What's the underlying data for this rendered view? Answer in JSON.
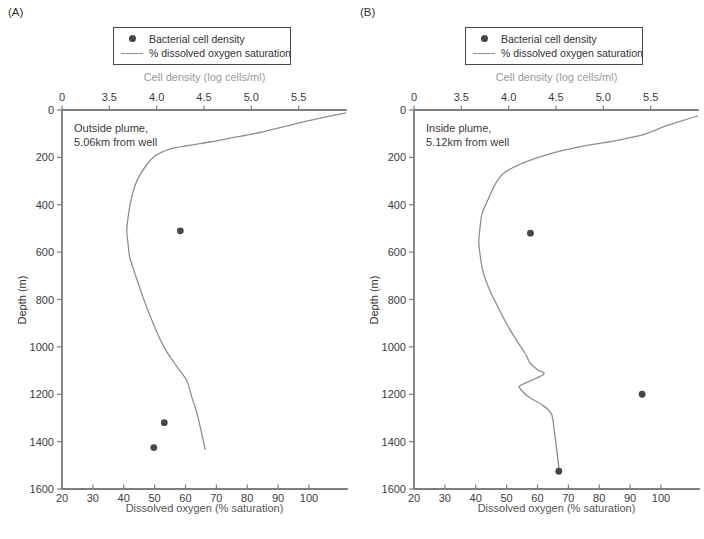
{
  "panels": {
    "a": {
      "letter": "(A)",
      "annotation_line1": "Outside plume,",
      "annotation_line2": "5.06km from well",
      "top_axis_label": "Cell density (log cells/ml)",
      "bottom_axis_label": "Dissolved oxygen (% saturation)",
      "y_axis_label": "Depth (m)"
    },
    "b": {
      "letter": "(B)",
      "annotation_line1": "Inside plume,",
      "annotation_line2": "5.12km from well",
      "top_axis_label": "Cell density (log cells/ml)",
      "bottom_axis_label": "Dissolved oxygen (% saturation)",
      "y_axis_label": "Depth (m)"
    }
  },
  "legend": {
    "items": [
      {
        "icon": "filled-circle",
        "label": "Bacterial cell density"
      },
      {
        "icon": "line",
        "label": "% dissolved oxygen saturation"
      }
    ]
  },
  "colors": {
    "axis": "#7f7f7f",
    "curve": "#8f8f8f",
    "dot": "#474747",
    "tick_text": "#3c3c3c",
    "top_label": "#9a9a9a",
    "bottom_label": "#555555",
    "text": "#333333"
  },
  "chart_data": [
    {
      "panel": "A",
      "type": "line",
      "title": "Outside plume, 5.06km from well",
      "x_top_axis": {
        "label": "Cell density (log cells/ml)",
        "tick_labels": [
          "0",
          "3.5",
          "4.0",
          "4.5",
          "5.0",
          "5.5"
        ],
        "units": "log cells/ml"
      },
      "x_bottom_axis": {
        "label": "Dissolved oxygen (% saturation)",
        "tick_labels": [
          "20",
          "30",
          "40",
          "50",
          "60",
          "70",
          "80",
          "90",
          "100"
        ],
        "range": [
          20,
          112
        ]
      },
      "y_axis": {
        "label": "Depth (m)",
        "tick_labels": [
          "0",
          "200",
          "400",
          "600",
          "800",
          "1000",
          "1200",
          "1400",
          "1600"
        ],
        "range": [
          0,
          1600
        ],
        "inverted": true
      },
      "oxygen_profile_pct_vs_depth_m": [
        [
          112,
          12
        ],
        [
          107,
          25
        ],
        [
          100,
          45
        ],
        [
          92,
          70
        ],
        [
          84,
          95
        ],
        [
          76,
          115
        ],
        [
          68,
          135
        ],
        [
          60,
          152
        ],
        [
          55,
          165
        ],
        [
          52,
          180
        ],
        [
          49.5,
          200
        ],
        [
          47.5,
          230
        ],
        [
          45.2,
          275
        ],
        [
          43.5,
          325
        ],
        [
          42.3,
          385
        ],
        [
          41.5,
          445
        ],
        [
          41,
          505
        ],
        [
          41.4,
          565
        ],
        [
          42,
          625
        ],
        [
          44,
          705
        ],
        [
          46.5,
          800
        ],
        [
          49.5,
          900
        ],
        [
          53,
          1000
        ],
        [
          56.5,
          1070
        ],
        [
          60.3,
          1140
        ],
        [
          62,
          1210
        ],
        [
          63.7,
          1280
        ],
        [
          65,
          1350
        ],
        [
          66.4,
          1435
        ]
      ],
      "cell_density_points_log_vs_depth_m": [
        [
          4.25,
          510
        ],
        [
          4.08,
          1320
        ],
        [
          3.97,
          1425
        ]
      ]
    },
    {
      "panel": "B",
      "type": "line",
      "title": "Inside plume, 5.12km from well",
      "x_top_axis": {
        "label": "Cell density (log cells/ml)",
        "tick_labels": [
          "0",
          "3.5",
          "4.0",
          "4.5",
          "5.0",
          "5.5"
        ],
        "units": "log cells/ml"
      },
      "x_bottom_axis": {
        "label": "Dissolved oxygen (% saturation)",
        "tick_labels": [
          "20",
          "30",
          "40",
          "50",
          "60",
          "70",
          "80",
          "90",
          "100"
        ],
        "range": [
          20,
          112
        ]
      },
      "y_axis": {
        "label": "Depth (m)",
        "tick_labels": [
          "0",
          "200",
          "400",
          "600",
          "800",
          "1000",
          "1200",
          "1400",
          "1600"
        ],
        "range": [
          0,
          1600
        ],
        "inverted": true
      },
      "oxygen_profile_pct_vs_depth_m": [
        [
          112,
          25
        ],
        [
          107,
          45
        ],
        [
          101,
          70
        ],
        [
          94,
          105
        ],
        [
          85,
          130
        ],
        [
          74,
          155
        ],
        [
          64,
          185
        ],
        [
          55,
          225
        ],
        [
          49,
          268
        ],
        [
          46,
          320
        ],
        [
          44.3,
          370
        ],
        [
          43.2,
          400
        ],
        [
          42,
          440
        ],
        [
          41.3,
          505
        ],
        [
          41,
          560
        ],
        [
          41.5,
          620
        ],
        [
          42.5,
          690
        ],
        [
          44.5,
          760
        ],
        [
          47.5,
          840
        ],
        [
          50.5,
          915
        ],
        [
          53.9,
          985
        ],
        [
          56.1,
          1030
        ],
        [
          57.7,
          1070
        ],
        [
          60.4,
          1100
        ],
        [
          61.9,
          1117
        ],
        [
          55,
          1160
        ],
        [
          54.2,
          1172
        ],
        [
          57,
          1210
        ],
        [
          61.5,
          1245
        ],
        [
          64.5,
          1283
        ],
        [
          65.4,
          1350
        ],
        [
          66.3,
          1440
        ],
        [
          67,
          1520
        ]
      ],
      "cell_density_points_log_vs_depth_m": [
        [
          4.23,
          520
        ],
        [
          5.41,
          1200
        ],
        [
          4.53,
          1525
        ]
      ]
    }
  ]
}
